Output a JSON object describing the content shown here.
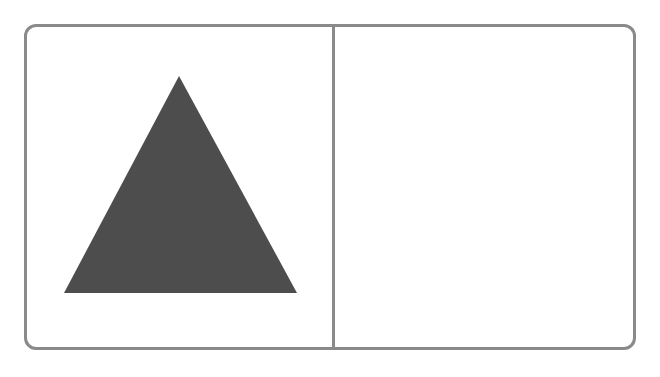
{
  "panels": {
    "left": {
      "shape": "triangle",
      "fill": "#4d4d4d",
      "points": [
        [
          179,
          76
        ],
        [
          64,
          293
        ],
        [
          297,
          293
        ]
      ]
    },
    "right": {
      "shape": "empty"
    }
  },
  "colors": {
    "border": "#8a8a8a",
    "shape": "#4d4d4d",
    "background": "#ffffff"
  }
}
